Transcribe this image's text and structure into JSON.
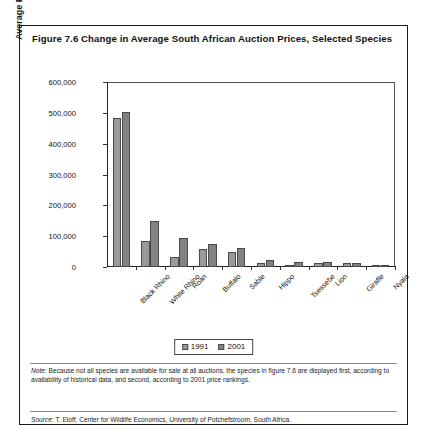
{
  "figure": {
    "title": "Figure 7.6  Change in Average South African Auction Prices, Selected Species",
    "note_label": "Note:",
    "note_text": " Because not all species are available for sale at all auctions, the species in figure 7.6 are displayed first, according to availability of historical data, and second, according to 2001 price rankings.",
    "source_label": "Source:",
    "source_text": " T. Eloff, Center for Wildlife Economics, University of Potchefstroom, South Africa."
  },
  "colors": {
    "series_1991": "#9a9a9a",
    "series_2001": "#828282",
    "bar_border": "#4a4a4a",
    "frame": "#1a1a1a"
  },
  "chart_data": {
    "type": "bar",
    "title": "Change in Average South African Auction Prices, Selected Species",
    "xlabel": "",
    "ylabel": "Average Price (rand)",
    "ylim": [
      0,
      600000
    ],
    "ytick_values": [
      0,
      100000,
      200000,
      300000,
      400000,
      500000,
      600000
    ],
    "ytick_labels": [
      "0",
      "100,000",
      "200,000",
      "300,000",
      "400,000",
      "500,000",
      "600,000"
    ],
    "grid": false,
    "legend_position": "bottom-center",
    "categories": [
      "Black Rhino",
      "White Rhino",
      "Roan",
      "Buffalo",
      "Sable",
      "Hippo",
      "Tsessebe",
      "Lion",
      "Giraffe",
      "Nyala"
    ],
    "series": [
      {
        "name": "1991",
        "values": [
          482000,
          85000,
          33000,
          58000,
          50000,
          14000,
          8000,
          12000,
          14000,
          4000
        ]
      },
      {
        "name": "2001",
        "values": [
          503000,
          149000,
          94000,
          74000,
          62000,
          23000,
          17000,
          16000,
          12000,
          7000
        ]
      }
    ]
  }
}
